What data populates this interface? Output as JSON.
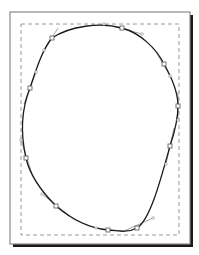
{
  "canvas": {
    "width": 199,
    "height": 255,
    "background": "#ffffff"
  },
  "page": {
    "x": 10,
    "y": 12,
    "width": 180,
    "height": 232,
    "border_color": "#8a8a8a",
    "shadow_color": "#1a1a1a",
    "shadow_offset": 3
  },
  "margin_guide": {
    "x": 21,
    "y": 24,
    "width": 158,
    "height": 211,
    "stroke": "#9a9a9a",
    "dash": "4,3"
  },
  "shape": {
    "type": "closed-bezier-path",
    "stroke": "#1a1a1a",
    "stroke_width": 1.3,
    "fill": "none",
    "nodes": [
      {
        "x": 52,
        "y": 38
      },
      {
        "x": 122,
        "y": 28
      },
      {
        "x": 164,
        "y": 64
      },
      {
        "x": 178,
        "y": 106
      },
      {
        "x": 170,
        "y": 146
      },
      {
        "x": 137,
        "y": 228
      },
      {
        "x": 108,
        "y": 230
      },
      {
        "x": 56,
        "y": 206
      },
      {
        "x": 26,
        "y": 158
      },
      {
        "x": 30,
        "y": 88
      }
    ],
    "node_color": "#555555",
    "handle_color": "#8a8a8a"
  }
}
